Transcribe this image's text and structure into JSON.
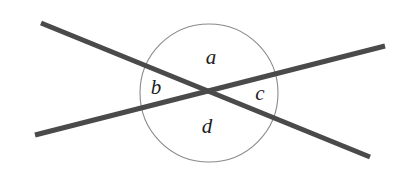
{
  "figure": {
    "canvas": {
      "width": 405,
      "height": 181,
      "background": "#ffffff"
    },
    "colors": {
      "line": "#4a4a4a",
      "circle": "#8a8a8a",
      "label": "#1d1d1d",
      "background": "#ffffff"
    },
    "circle": {
      "name": "angle-circle",
      "cx": 209,
      "cy": 93,
      "r": 69,
      "stroke_width": 1.1
    },
    "lines": [
      {
        "name": "line-descending",
        "x1": 41,
        "y1": 23,
        "x2": 370,
        "y2": 157,
        "stroke_width": 5
      },
      {
        "name": "line-ascending",
        "x1": 35,
        "y1": 135,
        "x2": 385,
        "y2": 46,
        "stroke_width": 5
      }
    ],
    "intersection": {
      "x": 208,
      "y": 91
    },
    "labels": [
      {
        "id": "a",
        "text": "a",
        "x": 211,
        "y": 59,
        "region": "top",
        "font_size": 21
      },
      {
        "id": "b",
        "text": "b",
        "x": 156,
        "y": 89,
        "region": "left",
        "font_size": 21
      },
      {
        "id": "c",
        "text": "c",
        "x": 260,
        "y": 95,
        "region": "right",
        "font_size": 21
      },
      {
        "id": "d",
        "text": "d",
        "x": 207,
        "y": 128,
        "region": "bottom",
        "font_size": 21
      }
    ]
  },
  "chart_data": {
    "type": "diagram",
    "elements": {
      "lines": 2,
      "intersections": 1,
      "sectors": 4
    },
    "sector_labels": [
      "a",
      "b",
      "c",
      "d"
    ],
    "sector_positions": [
      "top",
      "left",
      "right",
      "bottom"
    ],
    "vertical_angle_pairs": [
      [
        "a",
        "d"
      ],
      [
        "b",
        "c"
      ]
    ],
    "xlabel": "",
    "ylabel": "",
    "grid": false,
    "legend": false
  }
}
